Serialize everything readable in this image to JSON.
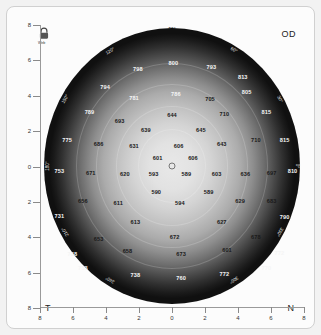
{
  "eye_label": "OD",
  "orientation": {
    "temporal": "T",
    "nasal": "N"
  },
  "icon": {
    "name": "lock-icon",
    "caption": "Web"
  },
  "axes": {
    "y_ticks": [
      "8",
      "6",
      "4",
      "2",
      "0",
      "2",
      "4",
      "6",
      "8"
    ],
    "x_ticks": [
      "8",
      "6",
      "4",
      "2",
      "0",
      "2",
      "4",
      "6",
      "8"
    ]
  },
  "degree_labels": [
    "90°",
    "120°",
    "150°",
    "180°",
    "210°",
    "240°",
    "270°",
    "300°",
    "330°",
    "60°",
    "30°",
    "0°"
  ],
  "chart_data": {
    "type": "heatmap",
    "xlabel": "",
    "ylabel": "",
    "xlim": [
      -8,
      8
    ],
    "ylim": [
      -8,
      8
    ],
    "grid": false,
    "legend": "none",
    "units": "microns",
    "center_value": 590,
    "points": [
      {
        "label": "800",
        "x": 50.5,
        "y": 13.5,
        "tone": "light"
      },
      {
        "label": "798",
        "x": 37.0,
        "y": 15.5,
        "tone": "light"
      },
      {
        "label": "793",
        "x": 65.0,
        "y": 15.0,
        "tone": "light"
      },
      {
        "label": "794",
        "x": 24.5,
        "y": 22.0,
        "tone": "light"
      },
      {
        "label": "813",
        "x": 77.0,
        "y": 18.5,
        "tone": "light"
      },
      {
        "label": "781",
        "x": 35.5,
        "y": 26.0,
        "tone": "light"
      },
      {
        "label": "786",
        "x": 51.5,
        "y": 24.5,
        "tone": "light"
      },
      {
        "label": "705",
        "x": 64.5,
        "y": 26.5,
        "tone": "dark"
      },
      {
        "label": "805",
        "x": 78.5,
        "y": 24.0,
        "tone": "light"
      },
      {
        "label": "789",
        "x": 18.5,
        "y": 31.0,
        "tone": "light"
      },
      {
        "label": "693",
        "x": 30.0,
        "y": 34.0,
        "tone": "dark"
      },
      {
        "label": "644",
        "x": 50.0,
        "y": 32.0,
        "tone": "dark"
      },
      {
        "label": "710",
        "x": 70.0,
        "y": 31.5,
        "tone": "dark"
      },
      {
        "label": "815",
        "x": 86.0,
        "y": 31.0,
        "tone": "light"
      },
      {
        "label": "639",
        "x": 40.0,
        "y": 37.5,
        "tone": "dark"
      },
      {
        "label": "645",
        "x": 61.0,
        "y": 37.5,
        "tone": "dark"
      },
      {
        "label": "775",
        "x": 10.0,
        "y": 41.0,
        "tone": "light"
      },
      {
        "label": "686",
        "x": 22.0,
        "y": 42.5,
        "tone": "dark"
      },
      {
        "label": "631",
        "x": 35.5,
        "y": 43.0,
        "tone": "dark"
      },
      {
        "label": "606",
        "x": 52.5,
        "y": 43.0,
        "tone": "dark"
      },
      {
        "label": "643",
        "x": 69.0,
        "y": 42.5,
        "tone": "dark"
      },
      {
        "label": "710",
        "x": 82.0,
        "y": 41.0,
        "tone": "dark"
      },
      {
        "label": "815",
        "x": 93.0,
        "y": 41.0,
        "tone": "light"
      },
      {
        "label": "601",
        "x": 44.5,
        "y": 47.5,
        "tone": "dark"
      },
      {
        "label": "606",
        "x": 58.0,
        "y": 47.5,
        "tone": "dark"
      },
      {
        "label": "753",
        "x": 7.0,
        "y": 52.0,
        "tone": "light"
      },
      {
        "label": "671",
        "x": 19.0,
        "y": 52.5,
        "tone": "dark"
      },
      {
        "label": "620",
        "x": 32.0,
        "y": 53.0,
        "tone": "dark"
      },
      {
        "label": "593",
        "x": 43.0,
        "y": 53.0,
        "tone": "dark"
      },
      {
        "label": "589",
        "x": 55.5,
        "y": 53.0,
        "tone": "dark"
      },
      {
        "label": "603",
        "x": 67.0,
        "y": 53.0,
        "tone": "dark"
      },
      {
        "label": "636",
        "x": 78.0,
        "y": 53.0,
        "tone": "dark"
      },
      {
        "label": "697",
        "x": 88.0,
        "y": 52.5,
        "tone": "dark"
      },
      {
        "label": "810",
        "x": 96.0,
        "y": 52.0,
        "tone": "light"
      },
      {
        "label": "590",
        "x": 44.0,
        "y": 59.5,
        "tone": "dark"
      },
      {
        "label": "589",
        "x": 64.0,
        "y": 59.5,
        "tone": "dark"
      },
      {
        "label": "594",
        "x": 53.0,
        "y": 63.5,
        "tone": "dark"
      },
      {
        "label": "656",
        "x": 16.0,
        "y": 62.5,
        "tone": "dark"
      },
      {
        "label": "611",
        "x": 29.5,
        "y": 63.5,
        "tone": "dark"
      },
      {
        "label": "629",
        "x": 76.0,
        "y": 62.5,
        "tone": "dark"
      },
      {
        "label": "683",
        "x": 88.0,
        "y": 62.5,
        "tone": "dark"
      },
      {
        "label": "731",
        "x": 7.0,
        "y": 68.0,
        "tone": "light"
      },
      {
        "label": "613",
        "x": 36.0,
        "y": 70.0,
        "tone": "dark"
      },
      {
        "label": "627",
        "x": 69.0,
        "y": 70.0,
        "tone": "dark"
      },
      {
        "label": "790",
        "x": 93.0,
        "y": 68.5,
        "tone": "light"
      },
      {
        "label": "653",
        "x": 22.0,
        "y": 76.0,
        "tone": "dark"
      },
      {
        "label": "672",
        "x": 51.0,
        "y": 75.5,
        "tone": "dark"
      },
      {
        "label": "678",
        "x": 82.0,
        "y": 75.5,
        "tone": "dark"
      },
      {
        "label": "738",
        "x": 12.0,
        "y": 81.5,
        "tone": "light"
      },
      {
        "label": "658",
        "x": 33.0,
        "y": 80.5,
        "tone": "dark"
      },
      {
        "label": "673",
        "x": 53.5,
        "y": 81.5,
        "tone": "dark"
      },
      {
        "label": "601",
        "x": 71.0,
        "y": 80.0,
        "tone": "dark"
      },
      {
        "label": "772",
        "x": 91.0,
        "y": 81.0,
        "tone": "light"
      },
      {
        "label": "733",
        "x": 16.0,
        "y": 86.5,
        "tone": "light"
      },
      {
        "label": "738",
        "x": 36.0,
        "y": 89.0,
        "tone": "light"
      },
      {
        "label": "760",
        "x": 53.5,
        "y": 90.0,
        "tone": "light"
      },
      {
        "label": "772",
        "x": 70.0,
        "y": 88.5,
        "tone": "light"
      },
      {
        "label": "770",
        "x": 86.0,
        "y": 86.5,
        "tone": "light"
      }
    ]
  }
}
